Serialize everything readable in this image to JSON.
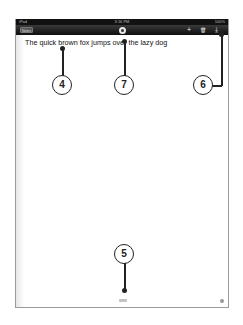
{
  "status_bar": {
    "device": "iPad",
    "time": "3:16 PM",
    "battery": "100%"
  },
  "toolbar": {
    "notes_button": "Notes",
    "center_button_icon": "record-circle-icon",
    "add_icon": "+",
    "trash_icon": "🗑",
    "share_icon": "⤓"
  },
  "document": {
    "text": "The quick brown fox jumps over the lazy dog"
  },
  "callouts": [
    {
      "label": "4"
    },
    {
      "label": "7"
    },
    {
      "label": "6"
    },
    {
      "label": "5"
    }
  ]
}
